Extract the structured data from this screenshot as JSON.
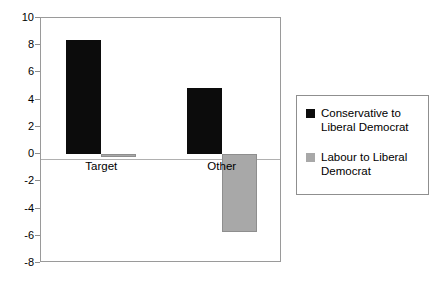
{
  "chart_data": {
    "type": "bar",
    "title": "",
    "subtitle": "",
    "xlabel": "",
    "ylabel": "",
    "categories": [
      "Target",
      "Other"
    ],
    "series": [
      {
        "name": "Conservative to Liberal Democrat",
        "color": "#0c0c0c",
        "values": [
          8.4,
          4.85
        ]
      },
      {
        "name": "Labour to Liberal Democrat",
        "color": "#a8a8a8",
        "values": [
          -0.2,
          -5.7
        ]
      }
    ],
    "ylim": [
      -8,
      10
    ],
    "ytick_values": [
      10,
      8,
      6,
      4,
      2,
      0,
      -2,
      -4,
      -6,
      -8
    ],
    "ytick_labels": [
      "10",
      "8",
      "6",
      "4",
      "2",
      "0",
      "-2",
      "-4",
      "-6",
      "-8"
    ],
    "grid": false,
    "legend_position": "right",
    "zero_line": true,
    "plot_border": true
  },
  "legend": {
    "entries": [
      {
        "label": "Conservative to Liberal Democrat",
        "swatch": "black-square-icon"
      },
      {
        "label": "Labour to Liberal Democrat",
        "swatch": "grey-square-icon"
      }
    ]
  },
  "colors": {
    "series_black": "#0c0c0c",
    "series_grey": "#a8a8a8",
    "axis": "#9a9a9a",
    "zero_line": "#b0b0b0",
    "background": "#ffffff"
  }
}
